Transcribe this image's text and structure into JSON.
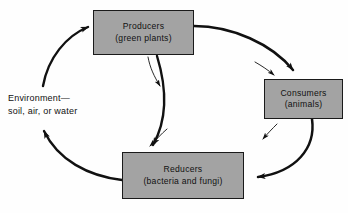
{
  "diagram": {
    "background_color": "#fefefe",
    "box_fill_color": "#a3a3a3",
    "box_border_color": "#1a1a1a",
    "arrow_color": "#111111",
    "nodes": [
      {
        "id": "producers",
        "line1": "Producers",
        "line2": "(green plants)"
      },
      {
        "id": "consumers",
        "line1": "Consumers",
        "line2": "(animals)"
      },
      {
        "id": "reducers",
        "line1": "Reducers",
        "line2": "(bacteria and fungi)"
      }
    ],
    "environment_label": {
      "line1": "Environment—",
      "line2": "soil, air, or water"
    },
    "connections": [
      {
        "id": "producers-to-consumers",
        "from": "producers",
        "to": "consumers",
        "style": "thick-curve"
      },
      {
        "id": "consumers-to-reducers",
        "from": "consumers",
        "to": "reducers",
        "style": "thick-curve"
      },
      {
        "id": "producers-to-reducers",
        "from": "producers",
        "to": "reducers",
        "style": "thick-curve"
      },
      {
        "id": "reducers-to-environment",
        "from": "reducers",
        "to": "environment",
        "style": "thick-curve"
      },
      {
        "id": "environment-to-producers",
        "from": "environment",
        "to": "producers",
        "style": "thick-curve"
      },
      {
        "id": "producers-to-environment-thin",
        "from": "producers",
        "to": "environment",
        "style": "thin-curve"
      },
      {
        "id": "consumers-to-environment-thin",
        "from": "consumers",
        "to": "environment",
        "style": "thin-curve"
      },
      {
        "id": "reducers-to-environment-thin",
        "from": "reducers",
        "to": "environment",
        "style": "thin-curve"
      },
      {
        "id": "producers-to-consumers-thin",
        "from": "producers",
        "to": "consumers",
        "style": "thin-curve"
      }
    ]
  }
}
